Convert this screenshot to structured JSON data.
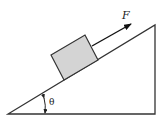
{
  "diagram": {
    "type": "physics-free-body",
    "labels": {
      "force": "F",
      "angle": "θ"
    },
    "colors": {
      "background": "#ffffff",
      "lines": "#333333",
      "block_fill": "#d4d4d4",
      "block_stroke": "#333333",
      "arrow": "#111111"
    }
  }
}
